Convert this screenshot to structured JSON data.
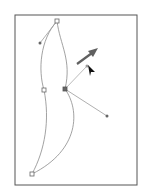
{
  "diagram": {
    "title": "",
    "colors": {
      "frame": "#555555",
      "path": "#8a8a8a",
      "handle_line": "#9a9a9a",
      "anchor_fill": "#666666",
      "arrow": "#606060",
      "cursor": "#111111"
    },
    "anchors": [
      {
        "name": "top-anchor",
        "x": 57,
        "y": 21,
        "selected": false
      },
      {
        "name": "left-middle-anchor",
        "x": 44,
        "y": 90,
        "selected": false
      },
      {
        "name": "center-anchor",
        "x": 65,
        "y": 89,
        "selected": true
      },
      {
        "name": "bottom-anchor",
        "x": 32,
        "y": 174,
        "selected": false
      }
    ],
    "handles": [
      {
        "name": "top-left-handle",
        "x": 40,
        "y": 43
      },
      {
        "name": "upper-right-handle",
        "x": 87,
        "y": 66
      },
      {
        "name": "lower-right-handle",
        "x": 107,
        "y": 116
      }
    ],
    "drag_arrow": {
      "from": [
        77,
        64
      ],
      "to": [
        97,
        49
      ]
    },
    "cursor": {
      "x": 88,
      "y": 66
    }
  }
}
